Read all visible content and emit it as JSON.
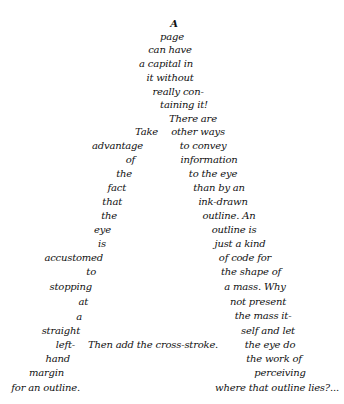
{
  "top_stanza": [
    "A",
    "page",
    "can have",
    "a capital in",
    "it without",
    "really con-",
    "taining it!",
    "There are"
  ],
  "left_stroke": [
    "Take",
    "advantage",
    "of",
    "the",
    "fact",
    "that",
    "the",
    "eye",
    "is",
    "accustomed",
    "to",
    "stopping",
    "at",
    "a",
    "straight",
    "left-",
    "hand",
    "margin",
    "for an outline."
  ],
  "right_stroke": [
    "other ways",
    "to convey",
    "information",
    "to the eye",
    "than by an",
    "ink-drawn",
    "outline. An",
    "outline is",
    "just a kind",
    "of code for",
    "the shape of",
    "a mass. Why",
    "not present",
    "the mass it-",
    "self and let",
    "the eye do",
    "the work of",
    "perceiving",
    "where that outline lies?..."
  ],
  "cross_stroke": "Then add the cross-stroke."
}
